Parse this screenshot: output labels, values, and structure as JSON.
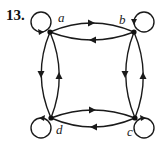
{
  "problem_number": "13.",
  "graph": {
    "type": "directed",
    "vertices": [
      {
        "id": "a",
        "label": "a",
        "x": 50,
        "y": 32
      },
      {
        "id": "b",
        "label": "b",
        "x": 134,
        "y": 32
      },
      {
        "id": "c",
        "label": "c",
        "x": 135,
        "y": 118
      },
      {
        "id": "d",
        "label": "d",
        "x": 51,
        "y": 118
      }
    ],
    "edges": [
      {
        "from": "a",
        "to": "a",
        "kind": "loop"
      },
      {
        "from": "b",
        "to": "b",
        "kind": "loop"
      },
      {
        "from": "c",
        "to": "c",
        "kind": "loop"
      },
      {
        "from": "d",
        "to": "d",
        "kind": "loop"
      },
      {
        "from": "a",
        "to": "b"
      },
      {
        "from": "b",
        "to": "a"
      },
      {
        "from": "d",
        "to": "c"
      },
      {
        "from": "c",
        "to": "d"
      },
      {
        "from": "a",
        "to": "d"
      },
      {
        "from": "d",
        "to": "a"
      },
      {
        "from": "b",
        "to": "c"
      },
      {
        "from": "c",
        "to": "b"
      }
    ]
  },
  "colors": {
    "stroke": "#1a1a1a",
    "background": "#ffffff"
  }
}
